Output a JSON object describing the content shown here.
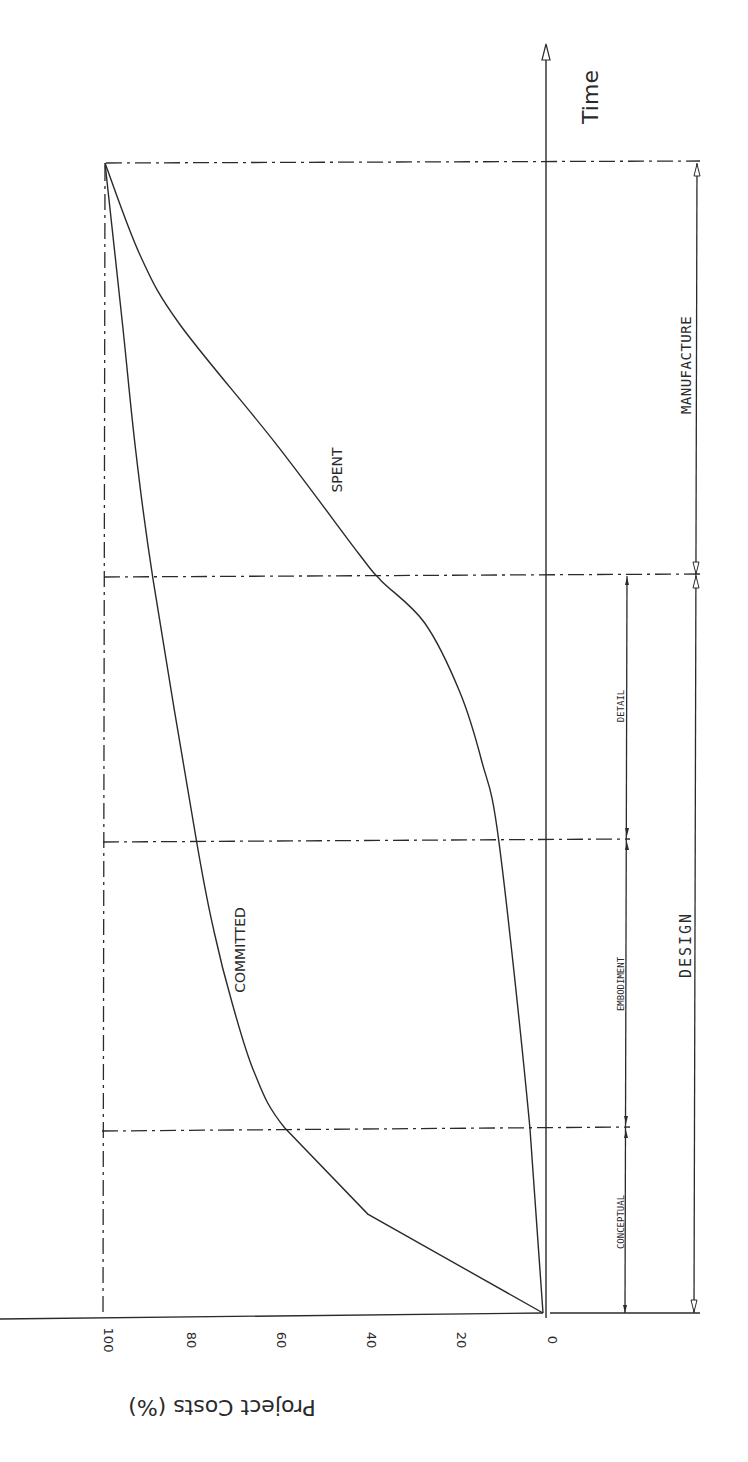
{
  "chart_data": {
    "type": "line",
    "orientation": "rotated-90-ccw",
    "title": "",
    "xlabel": "Time",
    "ylabel": "Project Costs (%)",
    "ylim": [
      0,
      100
    ],
    "yticks": [
      0,
      20,
      40,
      60,
      80,
      100
    ],
    "grid": false,
    "x_unit": "relative time (0 = start, 1 = end of manufacture)",
    "phases": [
      {
        "name": "CONCEPTUAL",
        "group": "DESIGN",
        "start": 0.0,
        "end": 0.161
      },
      {
        "name": "EMBODIMENT",
        "group": "DESIGN",
        "start": 0.161,
        "end": 0.408
      },
      {
        "name": "DETAIL",
        "group": "DESIGN",
        "start": 0.408,
        "end": 0.637
      },
      {
        "name": "MANUFACTURE",
        "group": "MANUFACTURE",
        "start": 0.637,
        "end": 1.0
      }
    ],
    "groups": [
      {
        "name": "DESIGN",
        "start": 0.0,
        "end": 0.637
      },
      {
        "name": "MANUFACTURE",
        "start": 0.637,
        "end": 1.0
      }
    ],
    "series": [
      {
        "name": "COMMITTED",
        "x": [
          0.0,
          0.086,
          0.161,
          0.21,
          0.27,
          0.33,
          0.408,
          0.637,
          0.75,
          0.86,
          1.0
        ],
        "values": [
          0,
          40,
          59,
          66,
          71,
          75,
          79,
          89,
          93,
          96,
          100
        ]
      },
      {
        "name": "SPENT",
        "x": [
          0.0,
          0.161,
          0.408,
          0.48,
          0.54,
          0.6,
          0.637,
          0.66,
          0.756,
          0.86,
          0.92,
          1.0
        ],
        "values": [
          0,
          3,
          10,
          14,
          19,
          27,
          37,
          42,
          61,
          83,
          92,
          100
        ]
      }
    ],
    "annotations": [
      {
        "text": "COMMITTED",
        "x": 0.29,
        "y": 68
      },
      {
        "text": "SPENT",
        "x": 0.72,
        "y": 42
      }
    ]
  },
  "labels": {
    "time_axis": "Time",
    "cost_axis": "Project Costs (%)",
    "committed": "COMMITTED",
    "spent": "SPENT",
    "design": "DESIGN",
    "manufacture": "MANUFACTURE",
    "conceptual": "CONCEPTUAL",
    "embodiment": "EMBODIMENT",
    "detail": "DETAIL",
    "tick_0": "0",
    "tick_20": "20",
    "tick_40": "40",
    "tick_60": "60",
    "tick_80": "80",
    "tick_100": "100"
  },
  "colors": {
    "ink": "#2a2a2a",
    "background": "#ffffff"
  }
}
